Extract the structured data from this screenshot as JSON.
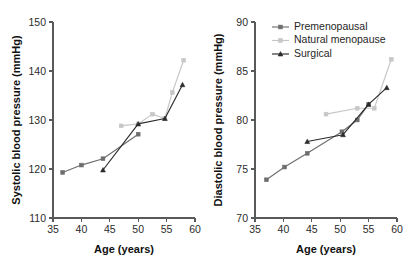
{
  "figure": {
    "type": "two-panel-line-chart",
    "background": "#ffffff"
  },
  "series_styles": {
    "premenopausal": {
      "color": "#6e6e6e",
      "marker": "square"
    },
    "natural_menopause": {
      "color": "#c7c7c7",
      "marker": "square"
    },
    "surgical": {
      "color": "#2b2b2b",
      "marker": "triangle"
    }
  },
  "legend": {
    "position": "top-right-of-right-panel",
    "entries": [
      {
        "label": "Premenopausal",
        "color": "#6e6e6e",
        "marker": "square"
      },
      {
        "label": "Natural menopause",
        "color": "#c7c7c7",
        "marker": "square"
      },
      {
        "label": "Surgical",
        "color": "#2b2b2b",
        "marker": "triangle"
      }
    ]
  },
  "chart_data": [
    {
      "id": "systolic",
      "type": "line",
      "title": "",
      "xlabel": "Age (years)",
      "ylabel": "Systolic blood pressure (mmHg)",
      "xlim": [
        35,
        60
      ],
      "ylim": [
        110,
        150
      ],
      "xticks": [
        35,
        40,
        45,
        50,
        55,
        60
      ],
      "yticks": [
        110,
        120,
        130,
        140,
        150
      ],
      "grid": false,
      "series": [
        {
          "name": "Premenopausal",
          "color": "#6e6e6e",
          "marker": "square",
          "x": [
            36.7,
            40.0,
            43.8,
            50.0
          ],
          "y": [
            119.3,
            120.8,
            122.1,
            127.1
          ]
        },
        {
          "name": "Natural menopause",
          "color": "#c7c7c7",
          "marker": "square",
          "x": [
            47.0,
            50.0,
            52.5,
            54.7,
            56.0,
            58.0
          ],
          "y": [
            128.8,
            129.2,
            131.2,
            130.3,
            135.6,
            142.2
          ]
        },
        {
          "name": "Surgical",
          "color": "#2b2b2b",
          "marker": "triangle",
          "x": [
            43.8,
            50.0,
            54.7,
            57.8
          ],
          "y": [
            119.8,
            129.2,
            130.3,
            137.2
          ]
        }
      ]
    },
    {
      "id": "diastolic",
      "type": "line",
      "title": "",
      "xlabel": "Age (years)",
      "ylabel": "Diastolic blood pressure (mmHg)",
      "xlim": [
        35,
        60
      ],
      "ylim": [
        70,
        90
      ],
      "xticks": [
        35,
        40,
        45,
        50,
        55,
        60
      ],
      "yticks": [
        70,
        75,
        80,
        85,
        90
      ],
      "grid": false,
      "series": [
        {
          "name": "Premenopausal",
          "color": "#6e6e6e",
          "marker": "square",
          "x": [
            37.0,
            40.2,
            44.2,
            50.3,
            53.0,
            55.0
          ],
          "y": [
            73.9,
            75.2,
            76.6,
            78.8,
            80.0,
            81.6
          ]
        },
        {
          "name": "Natural menopause",
          "color": "#c7c7c7",
          "marker": "square",
          "x": [
            47.5,
            53.0,
            56.0,
            59.0
          ],
          "y": [
            80.6,
            81.2,
            81.2,
            86.2
          ]
        },
        {
          "name": "Surgical",
          "color": "#2b2b2b",
          "marker": "triangle",
          "x": [
            44.2,
            50.5,
            55.0,
            58.2
          ],
          "y": [
            77.8,
            78.5,
            81.6,
            83.3
          ]
        }
      ]
    }
  ]
}
